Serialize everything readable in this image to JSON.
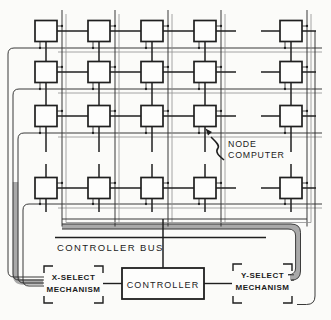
{
  "figure": {
    "labels": {
      "node_computer": [
        "NODE",
        "COMPUTER"
      ],
      "controller_bus": "CONTROLLER BUS",
      "controller": "CONTROLLER",
      "x_select": [
        "X-SELECT",
        "MECHANISM"
      ],
      "y_select": [
        "Y-SELECT",
        "MECHANISM"
      ]
    },
    "structure": {
      "visible_node_rows": 4,
      "visible_node_columns": 5
    },
    "colors": {
      "ink": "#1f1f1f",
      "bundle_gray": "#a9a9a9",
      "background": "#fbfbf9"
    }
  }
}
